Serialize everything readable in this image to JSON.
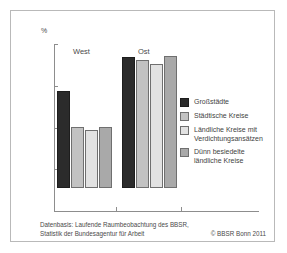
{
  "chart_data": {
    "type": "bar",
    "title": "",
    "xlabel": "",
    "ylabel": "%",
    "ylim": [
      0,
      20
    ],
    "yticks": [
      20,
      15,
      10,
      5,
      0
    ],
    "ytick_labels": [
      "20",
      "15",
      "10",
      "5",
      "0"
    ],
    "grid": false,
    "legend_position": "right",
    "categories": [
      "West",
      "Ost"
    ],
    "series": [
      {
        "name": "Großstädte",
        "color": "#2b2b2b",
        "values": [
          11.6,
          15.7
        ]
      },
      {
        "name": "Städtische Kreise",
        "color": "#c2c2c2",
        "values": [
          7.3,
          15.3
        ]
      },
      {
        "name": "Ländliche Kreise mit\nVerdichtungsansätzen",
        "color": "#e2e2e2",
        "values": [
          7.0,
          14.9
        ]
      },
      {
        "name": "Dünn besiedelte\nländliche Kreise",
        "color": "#a9a9a9",
        "values": [
          7.3,
          15.8
        ]
      }
    ]
  },
  "axis": {
    "unit_label": "%"
  },
  "groups": [
    {
      "label": "West"
    },
    {
      "label": "Ost"
    }
  ],
  "legend": {
    "items": [
      {
        "label": "Großstädte"
      },
      {
        "label": "Städtische Kreise"
      },
      {
        "label": "Ländliche Kreise mit\nVerdichtungsansätzen"
      },
      {
        "label": "Dünn besiedelte\nländliche Kreise"
      }
    ]
  },
  "footer": {
    "source": "Datenbasis: Laufende Raumbeobachtung des BBSR,\nStatistik der Bundesagentur für Arbeit",
    "copyright": "© BBSR Bonn 2011"
  }
}
